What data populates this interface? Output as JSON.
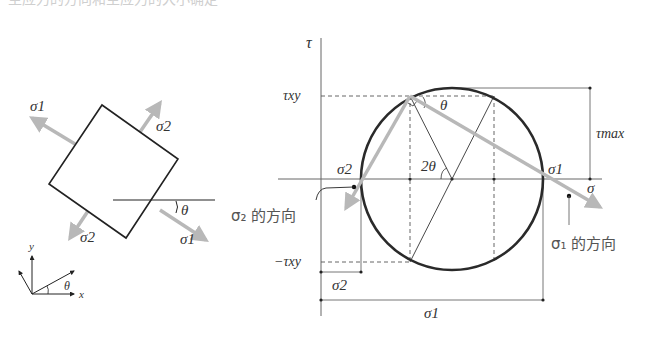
{
  "header": {
    "cropped_text": "主应力的方向和主应力的大小确定"
  },
  "element": {
    "labels": {
      "sigma1_top": "σ1",
      "sigma2_top": "σ2",
      "sigma2_bottom": "σ2",
      "sigma1_bottom": "σ1",
      "theta": "θ"
    },
    "square_corners": [
      [
        102,
        105
      ],
      [
        178,
        159
      ],
      [
        126,
        238
      ],
      [
        49,
        184
      ]
    ]
  },
  "axes_icon": {
    "x": "x",
    "y": "y",
    "theta": "θ"
  },
  "mohr": {
    "tau_axis": "τ",
    "sigma_axis": "σ",
    "tau_xy": "τxy",
    "neg_tau_xy": "−τxy",
    "tau_max": "τmax",
    "two_theta": "2θ",
    "theta": "θ",
    "sigma1": "σ1",
    "sigma2": "σ2",
    "sigma1_dim": "σ1",
    "sigma2_dim": "σ2",
    "sigma1_direction": "σ₁ 的方向",
    "sigma2_direction": "σ₂ 的方向",
    "center": [
      452,
      179
    ],
    "radius": 91
  },
  "colors": {
    "line": "#222222",
    "arrow": "#b8b8b8",
    "axis": "#666666",
    "circle": "#2a2a2a"
  }
}
